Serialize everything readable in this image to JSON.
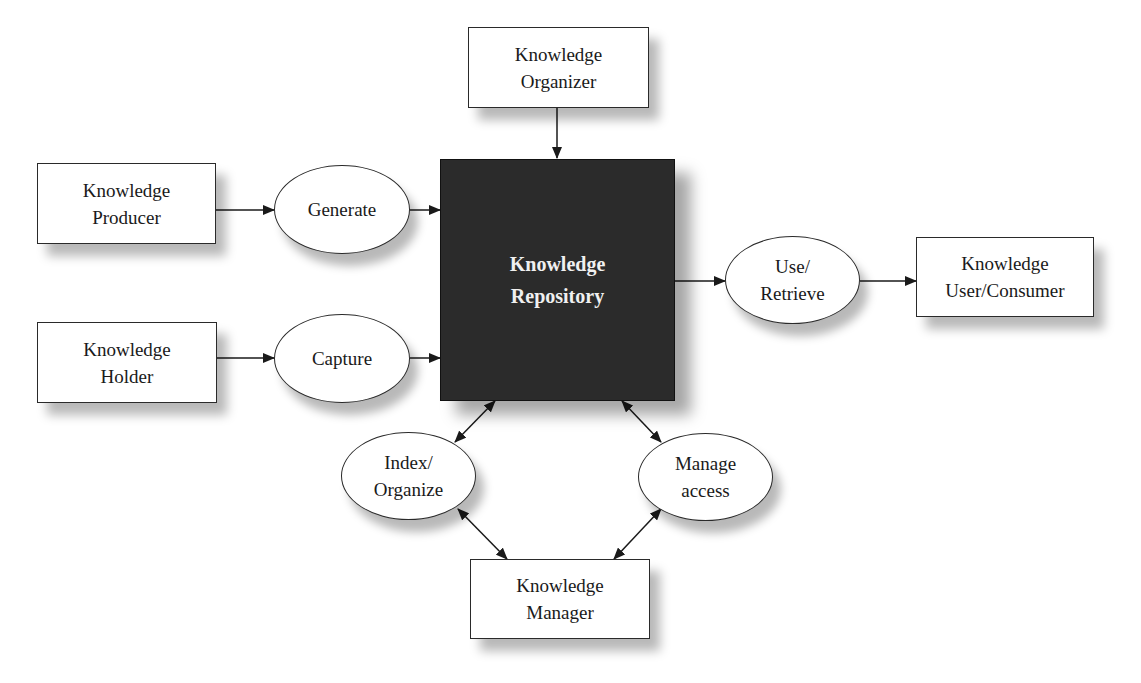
{
  "diagram": {
    "title": "",
    "nodes": {
      "organizer": {
        "label": "Knowledge\nOrganizer",
        "shape": "box"
      },
      "producer": {
        "label": "Knowledge\nProducer",
        "shape": "box"
      },
      "holder": {
        "label": "Knowledge\nHolder",
        "shape": "box"
      },
      "generate": {
        "label": "Generate",
        "shape": "ellipse"
      },
      "capture": {
        "label": "Capture",
        "shape": "ellipse"
      },
      "repository": {
        "label": "Knowledge\nRepository",
        "shape": "box-filled"
      },
      "use_retrieve": {
        "label": "Use/\nRetrieve",
        "shape": "ellipse"
      },
      "consumer": {
        "label": "Knowledge\nUser/Consumer",
        "shape": "box"
      },
      "index_organize": {
        "label": "Index/\nOrganize",
        "shape": "ellipse"
      },
      "manage_access": {
        "label": "Manage\naccess",
        "shape": "ellipse"
      },
      "manager": {
        "label": "Knowledge\nManager",
        "shape": "box"
      }
    },
    "edges": [
      {
        "from": "organizer",
        "to": "repository",
        "direction": "one-way"
      },
      {
        "from": "producer",
        "to": "generate",
        "direction": "one-way"
      },
      {
        "from": "generate",
        "to": "repository",
        "direction": "one-way"
      },
      {
        "from": "holder",
        "to": "capture",
        "direction": "one-way"
      },
      {
        "from": "capture",
        "to": "repository",
        "direction": "one-way"
      },
      {
        "from": "repository",
        "to": "use_retrieve",
        "direction": "one-way"
      },
      {
        "from": "use_retrieve",
        "to": "consumer",
        "direction": "one-way"
      },
      {
        "from": "repository",
        "to": "index_organize",
        "direction": "two-way"
      },
      {
        "from": "repository",
        "to": "manage_access",
        "direction": "two-way"
      },
      {
        "from": "index_organize",
        "to": "manager",
        "direction": "two-way"
      },
      {
        "from": "manage_access",
        "to": "manager",
        "direction": "two-way"
      }
    ],
    "colors": {
      "repository_fill": "#2b2b2b",
      "repository_text": "#f0f0f0",
      "line": "#1a1a1a"
    }
  }
}
